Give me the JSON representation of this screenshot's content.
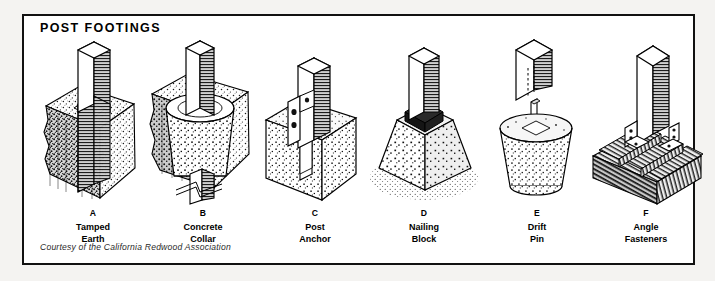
{
  "plate": {
    "title": "POST FOOTINGS",
    "credit": "Courtesy of the California Redwood Association",
    "border_color": "#111111",
    "background_color": "#ffffff",
    "page_background": "#f4f3f1",
    "ink_color": "#000000"
  },
  "figures": [
    {
      "letter": "A",
      "name": "Tamped\nEarth",
      "name_line1": "Tamped",
      "name_line2": "Earth",
      "icon": "post-in-tamped-earth-icon",
      "description": "Wood post set in a cutaway block of tamped earth"
    },
    {
      "letter": "B",
      "name": "Concrete\nCollar",
      "name_line1": "Concrete",
      "name_line2": "Collar",
      "icon": "post-with-concrete-collar-icon",
      "description": "Wood post with tapered concrete collar cast in earth"
    },
    {
      "letter": "C",
      "name": "Post\nAnchor",
      "name_line1": "Post",
      "name_line2": "Anchor",
      "icon": "metal-post-anchor-icon",
      "description": "Wood post held by bolted metal anchor strap in concrete block"
    },
    {
      "letter": "D",
      "name": "Nailing\nBlock",
      "name_line1": "Nailing",
      "name_line2": "Block",
      "icon": "nailing-block-pier-icon",
      "description": "Wood post on nailing block atop tapered concrete pier"
    },
    {
      "letter": "E",
      "name": "Drift\nPin",
      "name_line1": "Drift",
      "name_line2": "Pin",
      "icon": "drift-pin-pier-icon",
      "description": "Drilled wood post lowered onto drift pin in round concrete pier"
    },
    {
      "letter": "F",
      "name": "Angle\nFasteners",
      "name_line1": "Angle",
      "name_line2": "Fasteners",
      "icon": "angle-fastener-deck-icon",
      "description": "Wood post fixed to deck framing with bolted angle fasteners"
    }
  ]
}
